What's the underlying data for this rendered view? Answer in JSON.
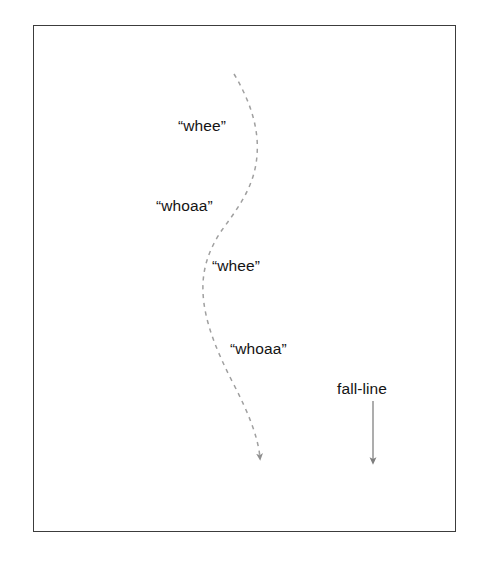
{
  "figure": {
    "background_color": "#ffffff",
    "frame": {
      "border_color": "#3c3c3c",
      "fill_color": "#ffffff"
    },
    "turn_path": {
      "name": "carved-turn-path",
      "style": "dashed",
      "stroke_color": "#a0a0a0",
      "arrowhead": "down",
      "description": "dashed S-shaped turning path descending across the fall-line"
    },
    "fall_line": {
      "name": "fall-line-arrow",
      "style": "solid",
      "stroke_color": "#8a8a8a",
      "arrowhead": "down",
      "description": "straight vertical arrow pointing downhill"
    },
    "labels": [
      {
        "id": "whee-1",
        "text": "“whee”",
        "role": "turn-phase-callout"
      },
      {
        "id": "whoaa-1",
        "text": "“whoaa”",
        "role": "turn-phase-callout"
      },
      {
        "id": "whee-2",
        "text": "“whee”",
        "role": "turn-phase-callout"
      },
      {
        "id": "whoaa-2",
        "text": "“whoaa”",
        "role": "turn-phase-callout"
      },
      {
        "id": "fall-line",
        "text": "fall-line",
        "role": "axis-annotation"
      }
    ]
  }
}
